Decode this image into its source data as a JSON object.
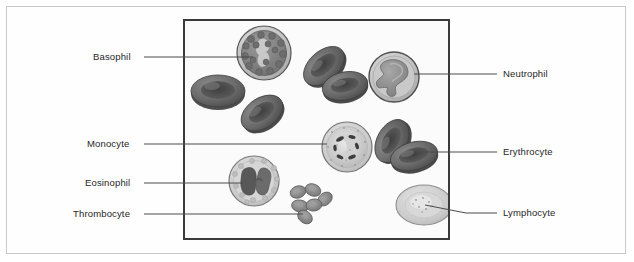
{
  "figure": {
    "title": "",
    "kind": "blood-cell-diagram",
    "frame": {
      "x": 183,
      "y": 19,
      "width": 267,
      "height": 221
    },
    "colors": {
      "frame_border": "#3a3a3a",
      "page_border": "#c9c9c9",
      "background": "#fbfbfb",
      "leader_line": "#4a4a4a",
      "label_text": "#262626",
      "erythrocyte_fill": "#6e6e6e",
      "erythrocyte_dark": "#4b4b4b",
      "neutrophil_fill": "#b9b9b9",
      "neutrophil_nucleus": "#8e8e8e",
      "basophil_fill": "#8a8a8a",
      "monocyte_fill": "#c3c3c3",
      "eosinophil_fill": "#cfcfcf",
      "lymphocyte_fill": "#c8c8c8",
      "thrombocyte_fill": "#8c8c8c"
    },
    "labels_left": [
      {
        "id": "basophil",
        "text": "Basophil",
        "x": 93,
        "y": 51,
        "line_x1": 144,
        "line_x2": 253,
        "line_y": 57
      },
      {
        "id": "monocyte",
        "text": "Monocyte",
        "x": 87,
        "y": 138,
        "line_x1": 144,
        "line_x2": 327,
        "line_y": 144
      },
      {
        "id": "eosinophil",
        "text": "Eosinophil",
        "x": 85,
        "y": 177,
        "line_x1": 144,
        "line_x2": 243,
        "line_y": 183
      },
      {
        "id": "thrombocyte",
        "text": "Thrombocyte",
        "x": 73,
        "y": 208,
        "line_x1": 144,
        "line_x2": 303,
        "line_y": 214
      }
    ],
    "labels_right": [
      {
        "id": "neutrophil",
        "text": "Neutrophil",
        "x": 503,
        "y": 69,
        "line_x1": 414,
        "line_x2": 497,
        "line_y": 74
      },
      {
        "id": "erythrocyte",
        "text": "Erythrocyte",
        "x": 503,
        "y": 147,
        "line_x1": 420,
        "line_x2": 497,
        "line_y": 152
      },
      {
        "id": "lymphocyte",
        "text": "Lymphocyte",
        "x": 503,
        "y": 208,
        "line_x1": 425,
        "line_x2": 497,
        "line_y": 213
      }
    ],
    "cells": [
      {
        "id": "basophil",
        "name": "Basophil",
        "cx": 264,
        "cy": 53,
        "r": 28
      },
      {
        "id": "neutrophil",
        "name": "Neutrophil",
        "cx": 394,
        "cy": 77,
        "r": 26
      },
      {
        "id": "monocyte",
        "name": "Monocyte",
        "cx": 347,
        "cy": 147,
        "r": 25
      },
      {
        "id": "eosinophil",
        "name": "Eosinophil",
        "cx": 254,
        "cy": 181,
        "r": 25
      },
      {
        "id": "lymphocyte",
        "name": "Lymphocyte",
        "cx": 424,
        "cy": 205,
        "r": 25
      },
      {
        "id": "erythrocyte-1",
        "name": "Erythrocyte",
        "cx": 218,
        "cy": 92,
        "rx": 27,
        "ry": 16
      },
      {
        "id": "erythrocyte-2",
        "name": "Erythrocyte",
        "cx": 262,
        "cy": 113,
        "rx": 22,
        "ry": 15
      },
      {
        "id": "erythrocyte-3",
        "name": "Erythrocyte",
        "cx": 325,
        "cy": 68,
        "rx": 24,
        "ry": 15
      },
      {
        "id": "erythrocyte-4",
        "name": "Erythrocyte",
        "cx": 343,
        "cy": 83,
        "rx": 23,
        "ry": 14
      },
      {
        "id": "erythrocyte-5",
        "name": "Erythrocyte",
        "cx": 392,
        "cy": 141,
        "rx": 21,
        "ry": 16
      },
      {
        "id": "erythrocyte-6",
        "name": "Erythrocyte",
        "cx": 413,
        "cy": 155,
        "rx": 23,
        "ry": 14
      },
      {
        "id": "thrombocyte-cluster",
        "name": "Thrombocyte",
        "cx": 310,
        "cy": 203,
        "count": 6
      }
    ]
  }
}
